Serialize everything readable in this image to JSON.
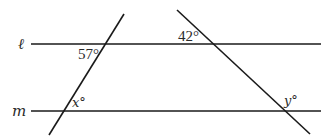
{
  "diagram": {
    "type": "parallel-lines-with-transversals",
    "lines": {
      "l": {
        "label": "ℓ",
        "y": 44,
        "x1": 31,
        "x2": 321
      },
      "m": {
        "label": "m",
        "y": 111,
        "x1": 31,
        "x2": 321
      }
    },
    "transversals": [
      {
        "name": "left-transversal",
        "x1": 124,
        "y1": 14,
        "x2": 49,
        "y2": 135
      },
      {
        "name": "right-transversal",
        "x1": 177,
        "y1": 10,
        "x2": 310,
        "y2": 134
      }
    ],
    "angles": {
      "a57": {
        "label": "57°"
      },
      "a42": {
        "label": "42°"
      },
      "x": {
        "label": "x°"
      },
      "y": {
        "label": "y°"
      }
    }
  }
}
